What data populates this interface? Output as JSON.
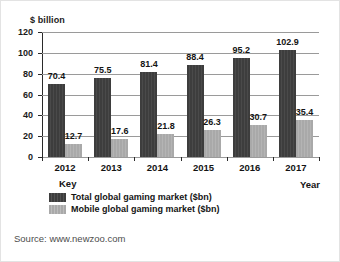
{
  "chart_data": {
    "type": "bar",
    "title": "",
    "xlabel": "Year",
    "ylabel": "$ billion",
    "ylim": [
      0,
      120
    ],
    "ytick_step": 20,
    "yticks": [
      "0",
      "20",
      "40",
      "60",
      "80",
      "100",
      "120"
    ],
    "grid": true,
    "legend_position": "below-left",
    "legend_title": "Key",
    "categories": [
      "2012",
      "2013",
      "2014",
      "2015",
      "2016",
      "2017"
    ],
    "series": [
      {
        "name": "Total global gaming market ($bn)",
        "color": "#3d3d3d",
        "values": [
          70.4,
          75.5,
          81.4,
          88.4,
          95.2,
          102.9
        ],
        "labels": [
          "70.4",
          "75.5",
          "81.4",
          "88.4",
          "95.2",
          "102.9"
        ]
      },
      {
        "name": "Mobile global gaming market ($bn)",
        "color": "#a9a9a9",
        "values": [
          12.7,
          17.6,
          21.8,
          26.3,
          30.7,
          35.4
        ],
        "labels": [
          "12.7",
          "17.6",
          "21.8",
          "26.3",
          "30.7",
          "35.4"
        ]
      }
    ]
  },
  "source": {
    "text": "Source: www.newzoo.com"
  }
}
